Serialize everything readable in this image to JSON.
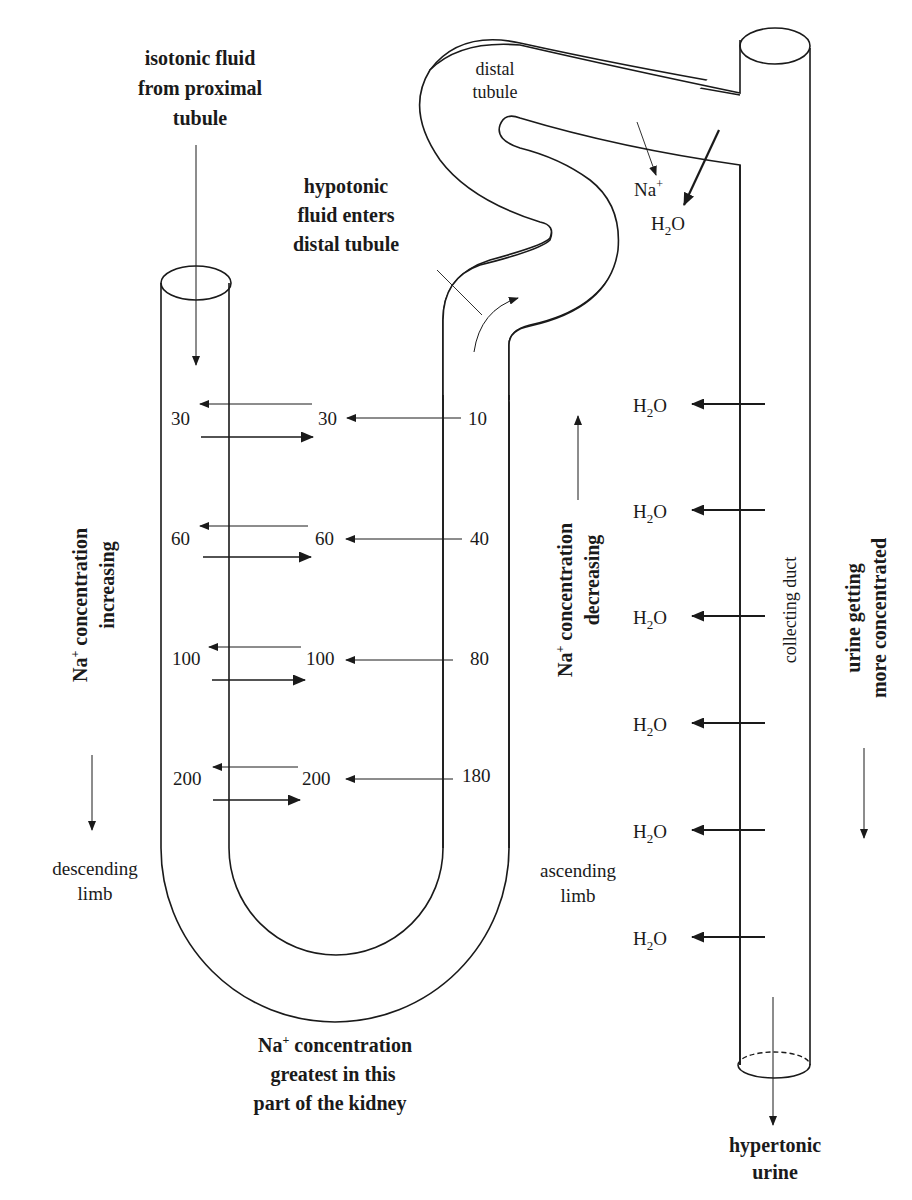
{
  "diagram": {
    "labels": {
      "isotonic": [
        "isotonic fluid",
        "from proximal",
        "tubule"
      ],
      "hypotonic": [
        "hypotonic",
        "fluid enters",
        "distal tubule"
      ],
      "distal_tubule": [
        "distal",
        "tubule"
      ],
      "na_top": "Na",
      "na_top_sup": "+",
      "h2o_top": "H",
      "h2o_sub": "2",
      "h2o_o": "O",
      "na_increasing": [
        "concentration",
        "increasing"
      ],
      "na_increasing_prefix": "Na",
      "na_decreasing": [
        "concentration",
        "decreasing"
      ],
      "na_decreasing_prefix": "Na",
      "plus": "+",
      "descending_limb": [
        "descending",
        "limb"
      ],
      "ascending_limb": [
        "ascending",
        "limb"
      ],
      "collecting_duct": "collecting duct",
      "urine_concentrated": [
        "urine getting",
        "more concentrated"
      ],
      "greatest": [
        "concentration",
        "greatest in this",
        "part of the kidney"
      ],
      "greatest_prefix": "Na",
      "hypertonic": [
        "hypertonic",
        "urine"
      ]
    },
    "levels": [
      {
        "descending_outer": "30",
        "descending_inner": "30",
        "ascending": "10"
      },
      {
        "descending_outer": "60",
        "descending_inner": "60",
        "ascending": "40"
      },
      {
        "descending_outer": "100",
        "descending_inner": "100",
        "ascending": "80"
      },
      {
        "descending_outer": "200",
        "descending_inner": "200",
        "ascending": "180"
      }
    ],
    "collecting_duct_water": [
      "H2O",
      "H2O",
      "H2O",
      "H2O",
      "H2O",
      "H2O"
    ]
  }
}
